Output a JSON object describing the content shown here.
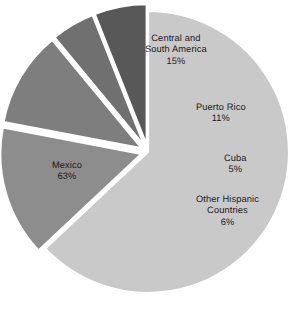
{
  "chart_data": {
    "type": "pie",
    "title": "",
    "subtitle": "",
    "xlabel": "",
    "ylabel": "",
    "legend_position": "none",
    "grid": false,
    "units": "percent",
    "total": 100,
    "categories": [
      "Mexico",
      "Central and South America",
      "Puerto Rico",
      "Cuba",
      "Other Hispanic Countries"
    ],
    "values": [
      63,
      15,
      11,
      5,
      6
    ],
    "slices": [
      {
        "label": "Mexico",
        "label_line1": "Mexico",
        "value": 63,
        "value_text": "63%",
        "color": "#c9c9c9",
        "exploded": false,
        "label_x": 52,
        "label_y": 160
      },
      {
        "label": "Central and South America",
        "label_line1": "Central and",
        "label_line2": "South America",
        "value": 15,
        "value_text": "15%",
        "color": "#8d8d8d",
        "exploded": true,
        "label_x": 145,
        "label_y": 33
      },
      {
        "label": "Puerto Rico",
        "label_line1": "Puerto Rico",
        "value": 11,
        "value_text": "11%",
        "color": "#7e7e7e",
        "exploded": true,
        "label_x": 196,
        "label_y": 102
      },
      {
        "label": "Cuba",
        "label_line1": "Cuba",
        "value": 5,
        "value_text": "5%",
        "color": "#707070",
        "exploded": true,
        "label_x": 224,
        "label_y": 153
      },
      {
        "label": "Other Hispanic Countries",
        "label_line1": "Other Hispanic",
        "label_line2": "Countries",
        "value": 6,
        "value_text": "6%",
        "color": "#585858",
        "exploded": true,
        "label_x": 196,
        "label_y": 194
      }
    ],
    "geometry": {
      "center_x": 148,
      "center_y": 152,
      "radius": 141,
      "start_angle_deg": -90,
      "explode_offset": 7,
      "direction": "clockwise"
    },
    "colors": {
      "background": "#ffffff",
      "label_text": "#1b1b1b",
      "slice_border": "#ffffff"
    }
  }
}
